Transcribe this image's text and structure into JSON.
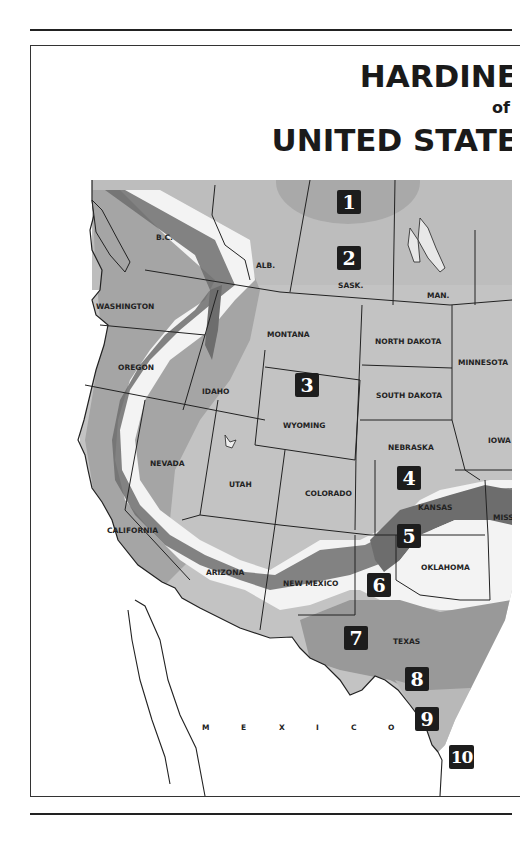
{
  "title": {
    "line1": "HARDINE",
    "line2": "of",
    "line3": "UNITED STATE"
  },
  "colors": {
    "zone_light_gray": "#c8c8c8",
    "zone_mid_gray": "#a7a7a7",
    "zone_dark_gray": "#6d6d6d",
    "zone_white": "#f4f4f4",
    "canada_gray": "#bdbdbd",
    "badge_bg": "#1d1d1d"
  },
  "regions": {
    "bc": "B.C.",
    "alb": "ALB.",
    "sask": "SASK.",
    "man": "MAN.",
    "washington": "WASHINGTON",
    "oregon": "OREGON",
    "idaho": "IDAHO",
    "montana": "MONTANA",
    "north_dakota": "NORTH DAKOTA",
    "south_dakota": "SOUTH DAKOTA",
    "minnesota": "MINNESOTA",
    "wyoming": "WYOMING",
    "nebraska": "NEBRASKA",
    "iowa": "IOWA",
    "nevada": "NEVADA",
    "utah": "UTAH",
    "colorado": "COLORADO",
    "kansas": "KANSAS",
    "missouri": "MISS",
    "california": "CALIFORNIA",
    "arizona": "ARIZONA",
    "new_mexico": "NEW MEXICO",
    "oklahoma": "OKLAHOMA",
    "texas": "TEXAS",
    "mexico_letters": [
      "M",
      "E",
      "X",
      "I",
      "C",
      "O"
    ]
  },
  "zones": [
    {
      "label": "1"
    },
    {
      "label": "2"
    },
    {
      "label": "3"
    },
    {
      "label": "4"
    },
    {
      "label": "5"
    },
    {
      "label": "6"
    },
    {
      "label": "7"
    },
    {
      "label": "8"
    },
    {
      "label": "9"
    },
    {
      "label": "10"
    }
  ]
}
